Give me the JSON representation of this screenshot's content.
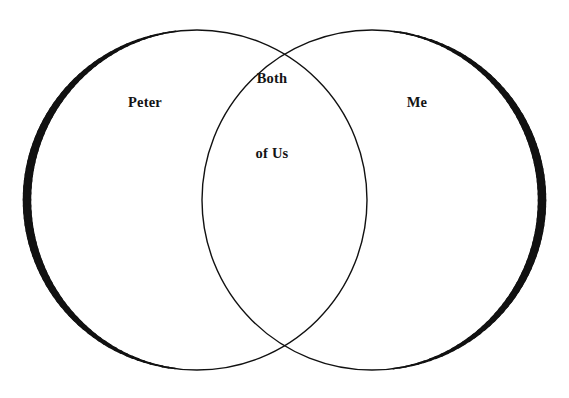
{
  "page": {
    "width": 569,
    "height": 398,
    "background_color": "#ffffff",
    "ink_color": "#111111"
  },
  "diagram": {
    "type": "venn-2-set",
    "left_circle": {
      "cx": 197,
      "cy": 200,
      "r": 170
    },
    "right_circle": {
      "cx": 372,
      "cy": 200,
      "r": 170
    },
    "stroke": {
      "outer_max_width": 8.5,
      "outer_min_width": 1.4,
      "inner_width": 1.4,
      "color": "#111111"
    }
  },
  "labels": {
    "left": {
      "name": "Peter",
      "text": "Peter",
      "x": 145,
      "y": 102
    },
    "intersection": {
      "name": "Both of Us",
      "line1": "Both",
      "line2": "of Us",
      "x": 272,
      "y": 116
    },
    "right": {
      "name": "Me",
      "text": "Me",
      "x": 417,
      "y": 102
    }
  }
}
